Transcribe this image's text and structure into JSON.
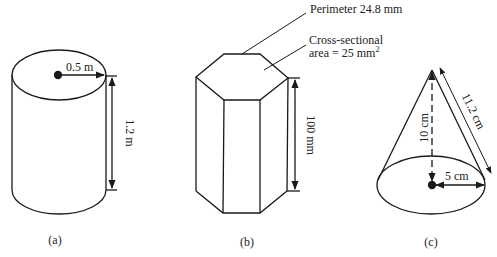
{
  "figures": {
    "a": {
      "shape": "cylinder",
      "caption": "(a)",
      "radius_label": "0.5 m",
      "height_label": "1.2 m"
    },
    "b": {
      "shape": "hexagonal prism",
      "caption": "(b)",
      "perimeter_label": "Perimeter 24.8 mm",
      "area_label_line1": "Cross-sectional",
      "area_label_line2": "area = 25 mm",
      "area_label_sup": "2",
      "height_label": "100 mm"
    },
    "c": {
      "shape": "cone",
      "caption": "(c)",
      "height_label": "10 cm",
      "slant_label": "11.2 cm",
      "radius_label": "5 cm"
    }
  },
  "colors": {
    "stroke": "#1a1a1a",
    "background": "#ffffff"
  }
}
